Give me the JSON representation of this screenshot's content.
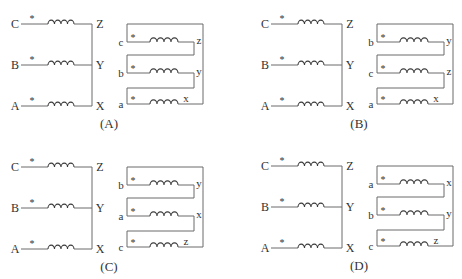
{
  "figure": {
    "colors": {
      "wire": "#6a6a6a",
      "coil": "#3a3a3a",
      "text": "#333333",
      "background": "#ffffff"
    }
  },
  "panels": [
    {
      "id": "A",
      "caption": "(A)",
      "offset": [
        0,
        0
      ],
      "primary": {
        "rows": [
          {
            "start": "C",
            "end": "Z",
            "polarity": "*"
          },
          {
            "start": "B",
            "end": "Y",
            "polarity": "*"
          },
          {
            "start": "A",
            "end": "X",
            "polarity": "*"
          }
        ]
      },
      "secondary": {
        "rows": [
          {
            "start": "c",
            "end": "z",
            "polarity": "*"
          },
          {
            "start": "b",
            "end": "y",
            "polarity": "*"
          },
          {
            "start": "a",
            "end": "x",
            "polarity": "*"
          }
        ]
      }
    },
    {
      "id": "B",
      "caption": "(B)",
      "offset": [
        250,
        0
      ],
      "primary": {
        "rows": [
          {
            "start": "C",
            "end": "Z",
            "polarity": "*"
          },
          {
            "start": "B",
            "end": "Y",
            "polarity": "*"
          },
          {
            "start": "A",
            "end": "X",
            "polarity": "*"
          }
        ]
      },
      "secondary": {
        "rows": [
          {
            "start": "b",
            "end": "y",
            "polarity": "*"
          },
          {
            "start": "c",
            "end": "z",
            "polarity": "*"
          },
          {
            "start": "a",
            "end": "x",
            "polarity": "*"
          }
        ]
      }
    },
    {
      "id": "C",
      "caption": "(C)",
      "offset": [
        0,
        143
      ],
      "primary": {
        "rows": [
          {
            "start": "C",
            "end": "Z",
            "polarity": "*"
          },
          {
            "start": "B",
            "end": "Y",
            "polarity": "*"
          },
          {
            "start": "A",
            "end": "X",
            "polarity": "*"
          }
        ]
      },
      "secondary": {
        "rows": [
          {
            "start": "b",
            "end": "y",
            "polarity": "*"
          },
          {
            "start": "a",
            "end": "x",
            "polarity": "*"
          },
          {
            "start": "c",
            "end": "z",
            "polarity": "*"
          }
        ]
      }
    },
    {
      "id": "D",
      "caption": "(D)",
      "offset": [
        250,
        142
      ],
      "primary": {
        "rows": [
          {
            "start": "C",
            "end": "Z",
            "polarity": "*"
          },
          {
            "start": "B",
            "end": "Y",
            "polarity": "*"
          },
          {
            "start": "A",
            "end": "X",
            "polarity": "*"
          }
        ]
      },
      "secondary": {
        "rows": [
          {
            "start": "a",
            "end": "x",
            "polarity": "*"
          },
          {
            "start": "b",
            "end": "y",
            "polarity": "*"
          },
          {
            "start": "c",
            "end": "z",
            "polarity": "*"
          }
        ]
      }
    }
  ]
}
